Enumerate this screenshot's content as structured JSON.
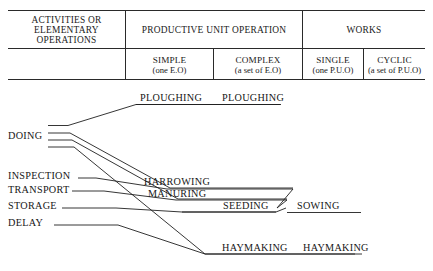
{
  "table": {
    "header_row": [
      {
        "id": "activities",
        "lines": [
          "ACTIVITIES OR",
          "ELEMENTARY",
          "OPERATIONS"
        ]
      },
      {
        "id": "productive-unit-operation",
        "lines": [
          "PRODUCTIVE UNIT OPERATION"
        ]
      },
      {
        "id": "works",
        "lines": [
          "WORKS"
        ]
      }
    ],
    "sub_row": [
      {
        "id": "blank",
        "title": "",
        "note": ""
      },
      {
        "id": "simple",
        "title": "SIMPLE",
        "note": "(one E.O)"
      },
      {
        "id": "complex",
        "title": "COMPLEX",
        "note": "(a set of E.O)"
      },
      {
        "id": "single",
        "title": "SINGLE",
        "note": "(one P.U.O)"
      },
      {
        "id": "cyclic",
        "title": "CYCLIC",
        "note": "(a set of P.U.O)"
      }
    ]
  },
  "diagram": {
    "left_labels": [
      {
        "id": "doing",
        "text": "DOING"
      },
      {
        "id": "inspection",
        "text": "INSPECTION"
      },
      {
        "id": "transport",
        "text": "TRANSPORT"
      },
      {
        "id": "storage",
        "text": "STORAGE"
      },
      {
        "id": "delay",
        "text": "DELAY"
      }
    ],
    "simple_ops": [
      {
        "id": "ploughing",
        "text": "PLOUGHING"
      },
      {
        "id": "harrowing",
        "text": "HARROWING"
      },
      {
        "id": "manuring",
        "text": "MANURING"
      },
      {
        "id": "seeding",
        "text": "SEEDING"
      },
      {
        "id": "haymaking",
        "text": "HAYMAKING"
      }
    ],
    "works": [
      {
        "id": "ploughing-work",
        "text": "PLOUGHING"
      },
      {
        "id": "sowing-work",
        "text": "SOWING"
      },
      {
        "id": "haymaking-work",
        "text": "HAYMAKING"
      }
    ]
  },
  "style": {
    "ink": "#1a1a1a",
    "background": "#ffffff"
  }
}
